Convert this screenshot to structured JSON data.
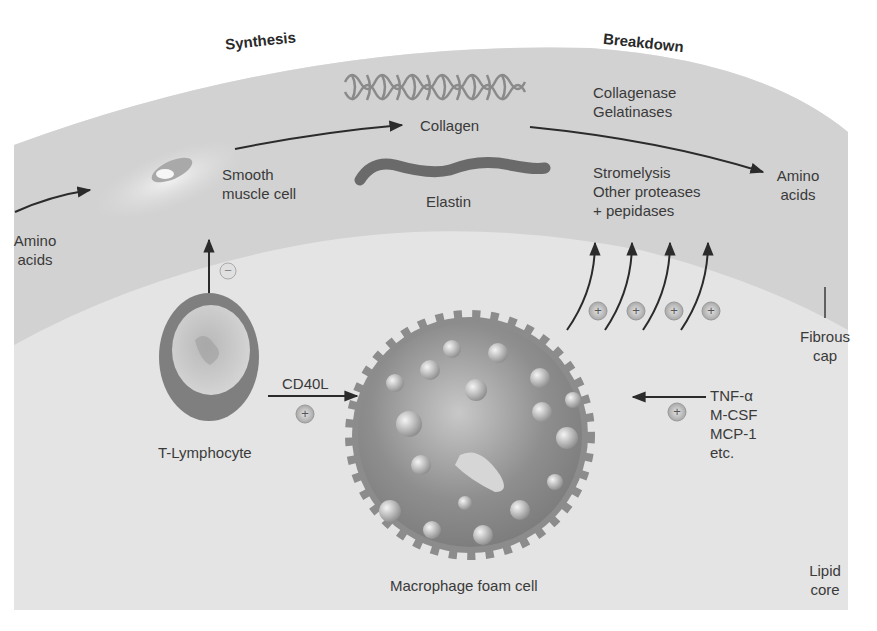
{
  "diagram": {
    "headings": {
      "synthesis": "Synthesis",
      "breakdown": "Breakdown"
    },
    "labels": {
      "amino_acids_left": [
        "Amino",
        "acids"
      ],
      "smooth_muscle_cell": [
        "Smooth",
        "muscle cell"
      ],
      "collagen": "Collagen",
      "elastin": "Elastin",
      "enzymes_top": [
        "Collagenase",
        "Gelatinases"
      ],
      "enzymes_bottom": [
        "Stromelysis",
        "Other proteases",
        "+ pepidases"
      ],
      "amino_acids_right": [
        "Amino",
        "acids"
      ],
      "fibrous_cap": [
        "Fibrous",
        "cap"
      ],
      "t_lymphocyte": "T-Lymphocyte",
      "cd40l": "CD40L",
      "cytokines": [
        "TNF-α",
        "M-CSF",
        "MCP-1",
        "etc."
      ],
      "macrophage": "Macrophage foam cell",
      "lipid_core": [
        "Lipid",
        "core"
      ]
    },
    "signs": {
      "inhibit": "−",
      "stimulate": "+"
    },
    "colors": {
      "fibrous_cap_band": "#d4d4d4",
      "lipid_core": "#e6e6e6",
      "arrow": "#2b2b2b",
      "text": "#3a3a3a",
      "cell_body": "#8a8a8a",
      "droplet": "#d8d8d8"
    }
  }
}
